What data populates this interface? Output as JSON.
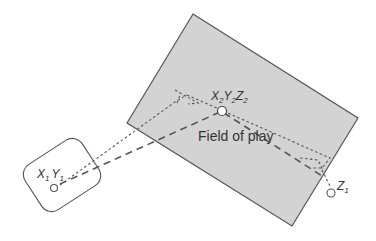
{
  "diagram": {
    "field_label": "Field of play",
    "camera_label": {
      "x": "X",
      "x_sub": "1",
      "y": "Y",
      "y_sub": "1"
    },
    "target_label": {
      "x": "X",
      "x_sub": "2",
      "y": "Y",
      "y_sub": "2",
      "z": "Z",
      "z_sub": "2"
    },
    "height_label": {
      "z": "Z",
      "z_sub": "1"
    },
    "colors": {
      "field_fill": "#d3d3d3",
      "field_stroke": "#555555",
      "line": "#555555",
      "background": "#ffffff"
    }
  }
}
